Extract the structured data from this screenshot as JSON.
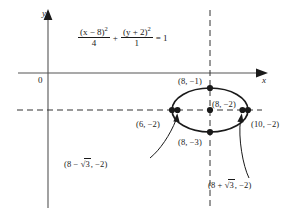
{
  "figure": {
    "type": "conic-section-diagram",
    "conic": "ellipse",
    "equation": {
      "numerator_1": "(x − 8)",
      "numerator_1_exp": "2",
      "denominator_1": "4",
      "plus": "+",
      "numerator_2": "(y + 2)",
      "numerator_2_exp": "2",
      "denominator_2": "1",
      "equals": "= 1"
    },
    "axes": {
      "x_label": "x",
      "y_label": "y",
      "origin_label": "0"
    },
    "points": [
      {
        "name": "top-covertex",
        "label": "(8, −1)"
      },
      {
        "name": "center",
        "label": "(8, −2)"
      },
      {
        "name": "left-vertex",
        "label": "(6, −2)"
      },
      {
        "name": "right-vertex",
        "label": "(10, −2)"
      },
      {
        "name": "bottom-covertex",
        "label": "(8, −3)"
      }
    ],
    "foci": [
      {
        "name": "left-focus",
        "prefix": "(8 − ",
        "radical": "3",
        "suffix": ", −2)"
      },
      {
        "name": "right-focus",
        "prefix": "(8 + ",
        "radical": "3",
        "suffix": ", −2)"
      }
    ],
    "colors": {
      "ink": "#1a1a1a",
      "axis": "#555555",
      "dashed": "#333333"
    }
  }
}
